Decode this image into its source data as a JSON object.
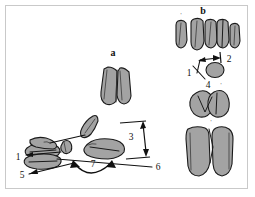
{
  "figure": {
    "background_color": "#ffffff",
    "frame_color": "#c9c9c9",
    "bone_fill_color": "#a3a3a3",
    "bone_outline_color": "#1a1a1a",
    "annotation_color": "#111111",
    "panels": [
      {
        "id": "a",
        "label": "a",
        "description": "lateral view of foot skeleton with angle measurements"
      },
      {
        "id": "b",
        "label": "b",
        "description": "dorsal view of phalanges and metatarsals"
      }
    ],
    "panel_labels": {
      "a": "a",
      "b": "b"
    },
    "measurement_labels": [
      {
        "id": "m1",
        "text": "1"
      },
      {
        "id": "m2",
        "text": "2"
      },
      {
        "id": "m3",
        "text": "3"
      },
      {
        "id": "m4",
        "text": "4"
      },
      {
        "id": "m5",
        "text": "5"
      },
      {
        "id": "m6",
        "text": "6"
      },
      {
        "id": "m7",
        "text": "7"
      }
    ],
    "tick_marks": [
      {
        "id": "t-b-left",
        "text": "'"
      },
      {
        "id": "t-b-right",
        "text": "'"
      },
      {
        "id": "t-4-right",
        "text": "'"
      },
      {
        "id": "t-lower-mid",
        "text": "'"
      }
    ]
  }
}
